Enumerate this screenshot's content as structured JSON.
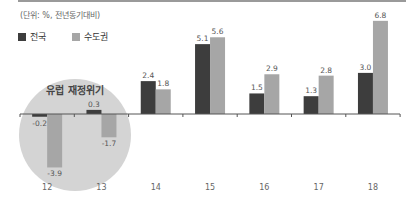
{
  "header": {
    "unit_note": "(단위: %, 전년동기대비)"
  },
  "legend": [
    {
      "label": "전국",
      "color": "#3d3d3d"
    },
    {
      "label": "수도권",
      "color": "#a6a6a6"
    }
  ],
  "annotation": {
    "label": "유럽 재정위기",
    "circle_color": "#d4d4d4"
  },
  "chart_data": {
    "type": "bar",
    "title": "",
    "subtitle": "(단위: %, 전년동기대비)",
    "xlabel": "",
    "ylabel": "",
    "categories": [
      "12",
      "13",
      "14",
      "15",
      "16",
      "17",
      "18"
    ],
    "series": [
      {
        "name": "전국",
        "color": "#3d3d3d",
        "values": [
          -0.2,
          0.3,
          2.4,
          5.1,
          1.5,
          1.3,
          3.0
        ]
      },
      {
        "name": "수도권",
        "color": "#a6a6a6",
        "values": [
          -3.9,
          -1.7,
          1.8,
          5.6,
          2.9,
          2.8,
          6.8
        ]
      }
    ],
    "data_labels": {
      "전국": [
        "-0.2",
        "0.3",
        "2.4",
        "5.1",
        "1.5",
        "1.3",
        "3.0"
      ],
      "수도권": [
        "-3.9",
        "-1.7",
        "1.8",
        "5.6",
        "2.9",
        "2.8",
        "6.8"
      ]
    },
    "annotations": [
      {
        "text": "유럽 재정위기",
        "covers_categories": [
          "12",
          "13"
        ],
        "shape": "circle"
      }
    ],
    "ylim": [
      -4.5,
      7.5
    ],
    "grid": false,
    "legend_position": "top-left"
  }
}
